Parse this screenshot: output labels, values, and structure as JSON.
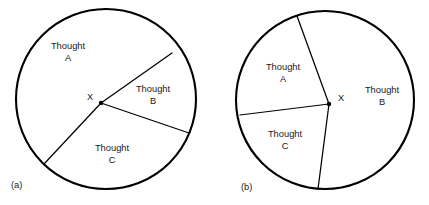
{
  "figure": {
    "kind": "two-circle-sector-diagram",
    "background_color": "#ffffff",
    "stroke_color": "#000000",
    "text_color": "#1a1a1a",
    "width": 429,
    "height": 205
  },
  "panels": [
    {
      "caption": "(a)",
      "caption_x": 11,
      "caption_y": 186,
      "circle": {
        "cx": 106,
        "cy": 99,
        "r": 90
      },
      "vertex": {
        "label": "X",
        "x": 101,
        "y": 103,
        "label_x": 90,
        "label_y": 98,
        "dot_r": 2.2
      },
      "radii": [
        {
          "name": "radius-upper-right",
          "x2": 172,
          "y2": 53
        },
        {
          "name": "radius-right",
          "x2": 189,
          "y2": 133
        },
        {
          "name": "radius-lower-left",
          "x2": 44,
          "y2": 164
        }
      ],
      "sectors": [
        {
          "name": "thought-a",
          "line1": "Thought",
          "line2": "A",
          "x": 68,
          "y": 53
        },
        {
          "name": "thought-b",
          "line1": "Thought",
          "line2": "B",
          "x": 153,
          "y": 96
        },
        {
          "name": "thought-c",
          "line1": "Thought",
          "line2": "C",
          "x": 112,
          "y": 155
        }
      ]
    },
    {
      "caption": "(b)",
      "caption_x": 241,
      "caption_y": 188,
      "circle": {
        "cx": 325,
        "cy": 100,
        "r": 89
      },
      "vertex": {
        "label": "X",
        "x": 329,
        "y": 104,
        "label_x": 341,
        "label_y": 99,
        "dot_r": 2.2
      },
      "radii": [
        {
          "name": "radius-upper",
          "x2": 297,
          "y2": 16
        },
        {
          "name": "radius-left",
          "x2": 240,
          "y2": 115
        },
        {
          "name": "radius-lower",
          "x2": 318,
          "y2": 189
        }
      ],
      "sectors": [
        {
          "name": "thought-a",
          "line1": "Thought",
          "line2": "A",
          "x": 283,
          "y": 74
        },
        {
          "name": "thought-b",
          "line1": "Thought",
          "line2": "B",
          "x": 382,
          "y": 97
        },
        {
          "name": "thought-c",
          "line1": "Thought",
          "line2": "C",
          "x": 285,
          "y": 141
        }
      ]
    }
  ]
}
